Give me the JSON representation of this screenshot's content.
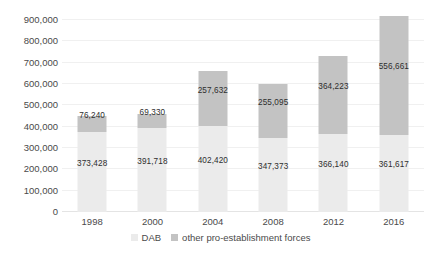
{
  "chart_data": {
    "type": "bar",
    "subtype": "stacked-column",
    "title": "",
    "xlabel": "",
    "ylabel": "",
    "categories": [
      "1998",
      "2000",
      "2004",
      "2008",
      "2012",
      "2016"
    ],
    "series": [
      {
        "name": "DAB",
        "color": "#ebebeb",
        "values": [
          373428,
          391718,
          402420,
          347373,
          366140,
          361617
        ],
        "labels": [
          "373,428",
          "391,718",
          "402,420",
          "347,373",
          "366,140",
          "361,617"
        ]
      },
      {
        "name": "other pro-establishment forces",
        "color": "#c3c3c3",
        "values": [
          76240,
          69330,
          257632,
          255095,
          364223,
          556661
        ],
        "labels": [
          "76,240",
          "69,330",
          "257,632",
          "255,095",
          "364,223",
          "556,661"
        ]
      }
    ],
    "totals": [
      449668,
      461048,
      660052,
      602468,
      730363,
      918278
    ],
    "ylim": [
      0,
      900000
    ],
    "ytick_values": [
      0,
      100000,
      200000,
      300000,
      400000,
      500000,
      600000,
      700000,
      800000,
      900000
    ],
    "ytick_labels": [
      "0",
      "100,000",
      "200,000",
      "300,000",
      "400,000",
      "500,000",
      "600,000",
      "700,000",
      "800,000",
      "900,000"
    ],
    "grid": true,
    "grid_color": "#f0f0f0",
    "legend_position": "bottom",
    "legend_entries": [
      "DAB",
      "other pro-establishment forces"
    ],
    "background": "#ffffff"
  }
}
